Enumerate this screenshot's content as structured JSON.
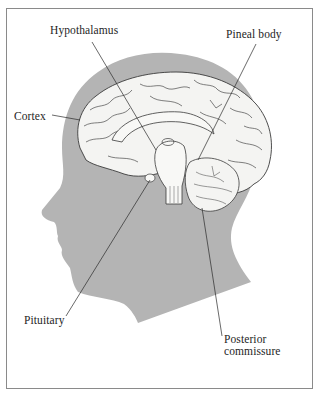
{
  "figure": {
    "colors": {
      "head_silhouette": "#b4b4b4",
      "brain_fill": "#f4f4f2",
      "outline": "#3a3a3a",
      "frame": "#8a8a8a"
    }
  },
  "labels": {
    "hypothalamus": "Hypothalamus",
    "pineal_body": "Pineal body",
    "cortex": "Cortex",
    "pituitary": "Pituitary",
    "posterior_commissure_line1": "Posterior",
    "posterior_commissure_line2": "commissure"
  }
}
